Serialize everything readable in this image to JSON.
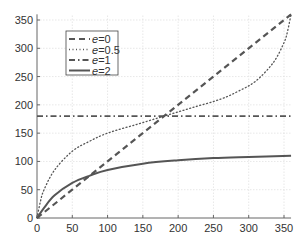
{
  "chart_data": {
    "type": "line",
    "title": "",
    "xlabel": "",
    "ylabel": "",
    "xlim": [
      0,
      360
    ],
    "ylim": [
      0,
      360
    ],
    "xticks": [
      0,
      50,
      100,
      150,
      200,
      250,
      300,
      350
    ],
    "yticks": [
      0,
      50,
      100,
      150,
      200,
      250,
      300,
      350
    ],
    "xtick_labels": [
      "0",
      "50",
      "100",
      "150",
      "200",
      "250",
      "300",
      "350"
    ],
    "ytick_labels": [
      "0",
      "50",
      "100",
      "150",
      "200",
      "250",
      "300",
      "350"
    ],
    "grid": true,
    "legend_position": "upper left",
    "series": [
      {
        "name": "e=0",
        "style": "dashed",
        "x": [
          0,
          360
        ],
        "y": [
          0,
          360
        ]
      },
      {
        "name": "e=0.5",
        "style": "dotted",
        "x": [
          0,
          5,
          10,
          25,
          50,
          75,
          100,
          140,
          180,
          220,
          260,
          285,
          310,
          335,
          350,
          355,
          360
        ],
        "y": [
          0,
          30,
          50,
          85,
          118,
          136,
          150,
          165,
          180,
          195,
          210,
          224,
          242,
          275,
          310,
          330,
          360
        ]
      },
      {
        "name": "e=1",
        "style": "dashdot",
        "x": [
          0,
          360
        ],
        "y": [
          180,
          180
        ]
      },
      {
        "name": "e=2",
        "style": "solid",
        "x": [
          0,
          10,
          25,
          50,
          75,
          100,
          150,
          200,
          250,
          300,
          360
        ],
        "y": [
          0,
          18,
          40,
          62,
          75,
          85,
          96,
          102,
          106,
          108,
          110
        ]
      }
    ]
  },
  "legend": {
    "items": [
      {
        "var": "e",
        "value": "=0"
      },
      {
        "var": "e",
        "value": "=0.5"
      },
      {
        "var": "e",
        "value": "=1"
      },
      {
        "var": "e",
        "value": "=2"
      }
    ]
  },
  "colors": {
    "line": "#555555",
    "axis": "#666666",
    "grid": "#dddddd",
    "text": "#333333"
  }
}
